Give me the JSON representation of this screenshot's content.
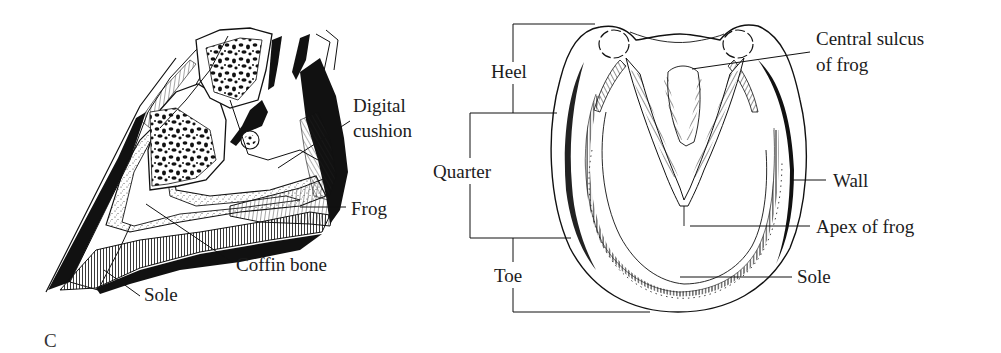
{
  "figure": {
    "panel_letter": "C",
    "sagittal_section": {
      "labels": {
        "digital_cushion_line1": "Digital",
        "digital_cushion_line2": "cushion",
        "frog": "Frog",
        "coffin_bone": "Coffin bone",
        "sole": "Sole"
      }
    },
    "ground_surface": {
      "region_brackets": {
        "heel": "Heel",
        "quarter": "Quarter",
        "toe": "Toe"
      },
      "labels": {
        "central_sulcus_line1": "Central sulcus",
        "central_sulcus_line2": "of frog",
        "wall": "Wall",
        "apex_of_frog": "Apex of frog",
        "sole": "Sole"
      }
    }
  }
}
